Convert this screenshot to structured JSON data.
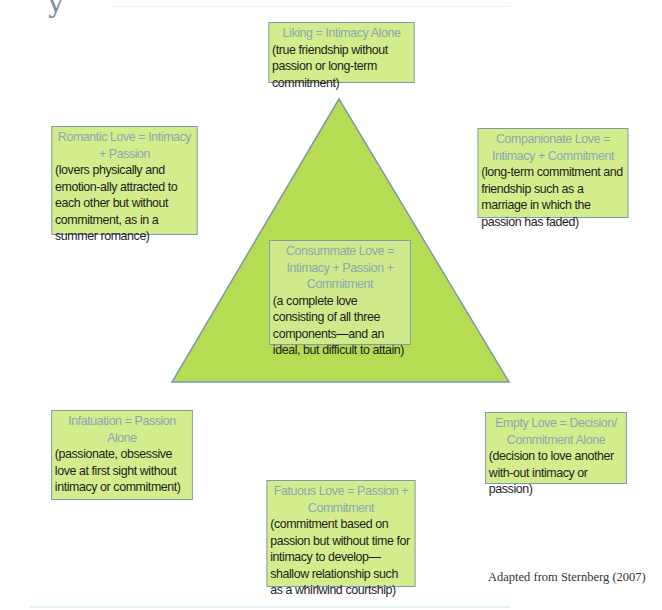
{
  "diagram": {
    "corner_glyph": "y",
    "colors": {
      "box_fill": "#d3ec8c",
      "triangle_fill": "#b5dc52",
      "border": "#7f98ab",
      "title_text": "#8ea6b3",
      "desc_text": "#1e1e1e"
    },
    "triangle": {
      "apex": [
        339,
        99
      ],
      "base_left": [
        172,
        382
      ],
      "base_right": [
        509,
        382
      ]
    },
    "boxes": {
      "liking": {
        "title": "Liking = Intimacy Alone",
        "desc": "(true friendship without passion or long-term commitment)"
      },
      "romantic": {
        "title": "Romantic Love = Intimacy + Passion",
        "desc": "(lovers physically and emotion-ally attracted to each other but without commitment, as in a summer romance)"
      },
      "companionate": {
        "title": "Companionate Love = Intimacy + Commitment",
        "desc": "(long-term commitment and friendship such as a marriage in which the passion has faded)"
      },
      "consummate": {
        "title": "Consummate Love = Intimacy + Passion + Commitment",
        "desc": "(a complete love consisting of all three components—and an ideal, but difficult to attain)"
      },
      "infatuation": {
        "title": "Infatuation = Passion Alone",
        "desc": "(passionate, obsessive love at first sight without intimacy or commitment)"
      },
      "empty": {
        "title": "Empty Love = Decision/ Commitment Alone",
        "desc": "(decision to love another with-out intimacy or passion)"
      },
      "fatuous": {
        "title": "Fatuous Love = Passion + Commitment",
        "desc": "(commitment based on passion but without time for intimacy to develop—shallow relationship such as a whirlwind courtship)"
      }
    },
    "caption": "Adapted from Sternberg (2007)"
  }
}
